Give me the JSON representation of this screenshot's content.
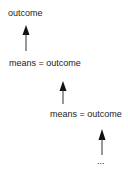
{
  "diagram": {
    "nodes": [
      {
        "id": "n1",
        "label": "outcome"
      },
      {
        "id": "n2",
        "label": "means = outcome"
      },
      {
        "id": "n3",
        "label": "means = outcome"
      },
      {
        "id": "n4",
        "label": "..."
      }
    ],
    "edges": [
      {
        "from": "n2",
        "to": "n1"
      },
      {
        "from": "n3",
        "to": "n2"
      },
      {
        "from": "n4",
        "to": "n3"
      }
    ],
    "colors": {
      "text": "#222222",
      "arrow": "#111111",
      "background": "#ffffff"
    }
  }
}
